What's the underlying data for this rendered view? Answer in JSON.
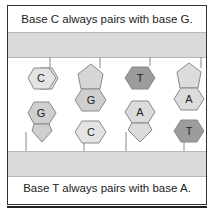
{
  "captions": {
    "top": "Base C always pairs with base G.",
    "bottom": "Base T always pairs with base A."
  },
  "colors": {
    "backbone": "#d9d9d9",
    "C": "#e4e4e4",
    "G": "#cfcfcf",
    "A": "#dcdcdc",
    "T": "#9c9c9c",
    "sugar": "#d6d6d6",
    "outline": "#888888"
  },
  "pairs": [
    {
      "top": "C",
      "bottom": "G",
      "sugar": "bottom"
    },
    {
      "top": "G",
      "bottom": "C",
      "sugar": "top"
    },
    {
      "top": "T",
      "bottom": "A",
      "sugar": "bottom"
    },
    {
      "top": "A",
      "bottom": "T",
      "sugar": "top"
    }
  ]
}
